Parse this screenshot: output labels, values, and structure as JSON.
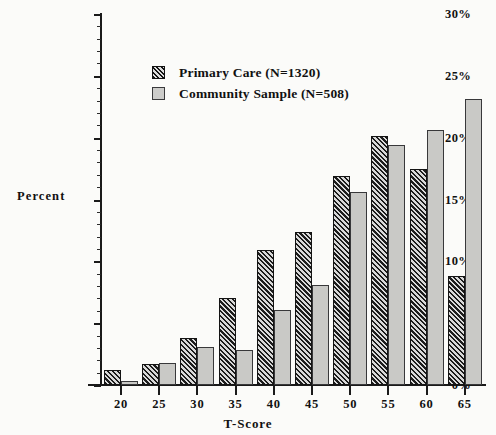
{
  "chart_data": {
    "type": "bar",
    "title": "",
    "xlabel": "T-Score",
    "ylabel": "Percent",
    "categories": [
      "20",
      "25",
      "30",
      "35",
      "40",
      "45",
      "50",
      "55",
      "60",
      "65"
    ],
    "series": [
      {
        "name": "Primary Care (N=1320)",
        "values": [
          1.2,
          1.7,
          3.8,
          7.0,
          10.9,
          12.4,
          16.9,
          20.1,
          17.5,
          8.8
        ],
        "color": "#1c1c1c",
        "fill": "diagonal-hatch"
      },
      {
        "name": "Community Sample (N=508)",
        "values": [
          0.3,
          1.8,
          3.1,
          2.8,
          6.1,
          8.1,
          15.6,
          19.4,
          20.6,
          23.1
        ],
        "color": "#c9c9c6",
        "fill": "solid-light-gray"
      }
    ],
    "ylim": [
      0,
      30
    ],
    "ytick_labels": [
      "0%",
      "5%",
      "10%",
      "15%",
      "20%",
      "25%",
      "30%"
    ],
    "ytick_values": [
      0,
      5,
      10,
      15,
      20,
      25,
      30
    ],
    "y_minor_tick_interval": 1,
    "grid": false,
    "legend_position": "upper-center-left",
    "value_unit": "%"
  },
  "axes": {
    "y_title": "Percent",
    "x_title": "T-Score"
  },
  "legend": {
    "entries": [
      {
        "label": "Primary Care (N=1320)",
        "swatch": "hatched-dark-swatch"
      },
      {
        "label": "Community Sample (N=508)",
        "swatch": "solid-gray-swatch"
      }
    ]
  }
}
